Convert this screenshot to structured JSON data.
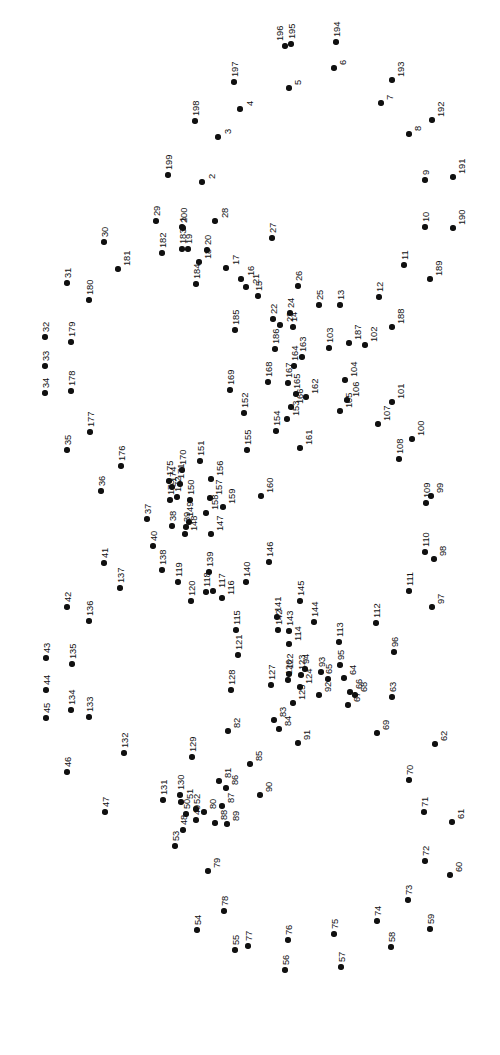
{
  "page": {
    "width": 500,
    "height": 1055,
    "background_color": "#ffffff",
    "dot_color": "#101010",
    "label_color": "#101010",
    "label_rotation_deg": -90,
    "dot_count": 200,
    "type": "connect-the-dots"
  },
  "dots": [
    {
      "n": "1",
      "x": 182,
      "y": 227,
      "lx": -4,
      "ly": -5
    },
    {
      "n": "2",
      "x": 202,
      "y": 182,
      "lx": 5,
      "ly": -3
    },
    {
      "n": "3",
      "x": 218,
      "y": 137,
      "lx": 5,
      "ly": -3
    },
    {
      "n": "4",
      "x": 240,
      "y": 109,
      "lx": 5,
      "ly": -3
    },
    {
      "n": "5",
      "x": 289,
      "y": 88,
      "lx": 4,
      "ly": -3
    },
    {
      "n": "6",
      "x": 334,
      "y": 68,
      "lx": 4,
      "ly": -3
    },
    {
      "n": "7",
      "x": 381,
      "y": 103,
      "lx": 4,
      "ly": -3
    },
    {
      "n": "8",
      "x": 409,
      "y": 134,
      "lx": 4,
      "ly": -3
    },
    {
      "n": "9",
      "x": 425,
      "y": 180,
      "lx": -4,
      "ly": -5
    },
    {
      "n": "10",
      "x": 425,
      "y": 227,
      "lx": -4,
      "ly": -5
    },
    {
      "n": "11",
      "x": 404,
      "y": 265,
      "lx": -4,
      "ly": -5
    },
    {
      "n": "12",
      "x": 379,
      "y": 297,
      "lx": -4,
      "ly": -5
    },
    {
      "n": "13",
      "x": 340,
      "y": 305,
      "lx": -4,
      "ly": -5
    },
    {
      "n": "14",
      "x": 293,
      "y": 327,
      "lx": -4,
      "ly": -5
    },
    {
      "n": "15",
      "x": 258,
      "y": 296,
      "lx": -4,
      "ly": -5
    },
    {
      "n": "16",
      "x": 241,
      "y": 279,
      "lx": 5,
      "ly": -3
    },
    {
      "n": "17",
      "x": 226,
      "y": 268,
      "lx": 5,
      "ly": -3
    },
    {
      "n": "18",
      "x": 199,
      "y": 262,
      "lx": 4,
      "ly": -3
    },
    {
      "n": "19",
      "x": 188,
      "y": 249,
      "lx": -4,
      "ly": -5
    },
    {
      "n": "20",
      "x": 207,
      "y": 250,
      "lx": -4,
      "ly": -5
    },
    {
      "n": "21",
      "x": 246,
      "y": 287,
      "lx": 5,
      "ly": -3
    },
    {
      "n": "22",
      "x": 273,
      "y": 319,
      "lx": -4,
      "ly": -5
    },
    {
      "n": "23",
      "x": 280,
      "y": 325,
      "lx": 5,
      "ly": -3
    },
    {
      "n": "24",
      "x": 290,
      "y": 313,
      "lx": -4,
      "ly": -5
    },
    {
      "n": "25",
      "x": 319,
      "y": 305,
      "lx": -4,
      "ly": -5
    },
    {
      "n": "26",
      "x": 298,
      "y": 286,
      "lx": -4,
      "ly": -5
    },
    {
      "n": "27",
      "x": 272,
      "y": 238,
      "lx": -4,
      "ly": -5
    },
    {
      "n": "28",
      "x": 215,
      "y": 221,
      "lx": 5,
      "ly": -3
    },
    {
      "n": "29",
      "x": 156,
      "y": 221,
      "lx": -4,
      "ly": -5
    },
    {
      "n": "30",
      "x": 104,
      "y": 242,
      "lx": -4,
      "ly": -5
    },
    {
      "n": "31",
      "x": 67,
      "y": 283,
      "lx": -4,
      "ly": -5
    },
    {
      "n": "32",
      "x": 45,
      "y": 337,
      "lx": -4,
      "ly": -5
    },
    {
      "n": "33",
      "x": 45,
      "y": 366,
      "lx": -4,
      "ly": -5
    },
    {
      "n": "34",
      "x": 45,
      "y": 393,
      "lx": -4,
      "ly": -5
    },
    {
      "n": "35",
      "x": 67,
      "y": 450,
      "lx": -4,
      "ly": -5
    },
    {
      "n": "36",
      "x": 101,
      "y": 491,
      "lx": -4,
      "ly": -5
    },
    {
      "n": "37",
      "x": 147,
      "y": 519,
      "lx": -4,
      "ly": -5
    },
    {
      "n": "38",
      "x": 172,
      "y": 526,
      "lx": -4,
      "ly": -5
    },
    {
      "n": "39",
      "x": 186,
      "y": 527,
      "lx": -4,
      "ly": -5
    },
    {
      "n": "40",
      "x": 153,
      "y": 546,
      "lx": -4,
      "ly": -5
    },
    {
      "n": "41",
      "x": 104,
      "y": 563,
      "lx": -4,
      "ly": -5
    },
    {
      "n": "42",
      "x": 67,
      "y": 607,
      "lx": -4,
      "ly": -5
    },
    {
      "n": "43",
      "x": 46,
      "y": 658,
      "lx": -4,
      "ly": -5
    },
    {
      "n": "44",
      "x": 46,
      "y": 690,
      "lx": -4,
      "ly": -5
    },
    {
      "n": "45",
      "x": 46,
      "y": 718,
      "lx": -4,
      "ly": -5
    },
    {
      "n": "46",
      "x": 67,
      "y": 772,
      "lx": -4,
      "ly": -5
    },
    {
      "n": "47",
      "x": 105,
      "y": 812,
      "lx": -4,
      "ly": -5
    },
    {
      "n": "48",
      "x": 183,
      "y": 830,
      "lx": -4,
      "ly": -5
    },
    {
      "n": "49",
      "x": 196,
      "y": 820,
      "lx": -4,
      "ly": -5
    },
    {
      "n": "50",
      "x": 186,
      "y": 814,
      "lx": -4,
      "ly": -5
    },
    {
      "n": "51",
      "x": 181,
      "y": 802,
      "lx": 4,
      "ly": -3
    },
    {
      "n": "52",
      "x": 196,
      "y": 809,
      "lx": -4,
      "ly": -5
    },
    {
      "n": "53",
      "x": 175,
      "y": 846,
      "lx": -4,
      "ly": -5
    },
    {
      "n": "54",
      "x": 197,
      "y": 930,
      "lx": -4,
      "ly": -5
    },
    {
      "n": "55",
      "x": 235,
      "y": 950,
      "lx": -4,
      "ly": -5
    },
    {
      "n": "56",
      "x": 285,
      "y": 970,
      "lx": -4,
      "ly": -5
    },
    {
      "n": "57",
      "x": 341,
      "y": 967,
      "lx": -4,
      "ly": -5
    },
    {
      "n": "58",
      "x": 391,
      "y": 947,
      "lx": -4,
      "ly": -5
    },
    {
      "n": "59",
      "x": 430,
      "y": 929,
      "lx": -4,
      "ly": -5
    },
    {
      "n": "60",
      "x": 450,
      "y": 875,
      "lx": 4,
      "ly": -3
    },
    {
      "n": "61",
      "x": 452,
      "y": 822,
      "lx": 4,
      "ly": -3
    },
    {
      "n": "62",
      "x": 435,
      "y": 744,
      "lx": 4,
      "ly": -3
    },
    {
      "n": "63",
      "x": 392,
      "y": 697,
      "lx": -4,
      "ly": -5
    },
    {
      "n": "64",
      "x": 344,
      "y": 678,
      "lx": 4,
      "ly": -3
    },
    {
      "n": "65",
      "x": 328,
      "y": 679,
      "lx": -4,
      "ly": -5
    },
    {
      "n": "66",
      "x": 350,
      "y": 692,
      "lx": 4,
      "ly": -3
    },
    {
      "n": "67",
      "x": 348,
      "y": 705,
      "lx": 4,
      "ly": -3
    },
    {
      "n": "68",
      "x": 355,
      "y": 695,
      "lx": 4,
      "ly": -3
    },
    {
      "n": "69",
      "x": 377,
      "y": 733,
      "lx": 4,
      "ly": -3
    },
    {
      "n": "70",
      "x": 409,
      "y": 780,
      "lx": -4,
      "ly": -5
    },
    {
      "n": "71",
      "x": 424,
      "y": 812,
      "lx": -4,
      "ly": -5
    },
    {
      "n": "72",
      "x": 425,
      "y": 861,
      "lx": -4,
      "ly": -5
    },
    {
      "n": "73",
      "x": 408,
      "y": 900,
      "lx": -4,
      "ly": -5
    },
    {
      "n": "74",
      "x": 377,
      "y": 921,
      "lx": -4,
      "ly": -5
    },
    {
      "n": "75",
      "x": 334,
      "y": 934,
      "lx": -4,
      "ly": -5
    },
    {
      "n": "76",
      "x": 288,
      "y": 940,
      "lx": -4,
      "ly": -5
    },
    {
      "n": "77",
      "x": 248,
      "y": 946,
      "lx": -4,
      "ly": -5
    },
    {
      "n": "78",
      "x": 224,
      "y": 911,
      "lx": -4,
      "ly": -5
    },
    {
      "n": "79",
      "x": 208,
      "y": 871,
      "lx": 4,
      "ly": -3
    },
    {
      "n": "80",
      "x": 204,
      "y": 812,
      "lx": 4,
      "ly": -3
    },
    {
      "n": "81",
      "x": 219,
      "y": 781,
      "lx": 4,
      "ly": -3
    },
    {
      "n": "82",
      "x": 228,
      "y": 731,
      "lx": 4,
      "ly": -3
    },
    {
      "n": "83",
      "x": 274,
      "y": 720,
      "lx": 4,
      "ly": -3
    },
    {
      "n": "84",
      "x": 279,
      "y": 729,
      "lx": 4,
      "ly": -3
    },
    {
      "n": "85",
      "x": 250,
      "y": 764,
      "lx": 4,
      "ly": -3
    },
    {
      "n": "86",
      "x": 226,
      "y": 788,
      "lx": 4,
      "ly": -3
    },
    {
      "n": "87",
      "x": 222,
      "y": 806,
      "lx": 4,
      "ly": -3
    },
    {
      "n": "88",
      "x": 215,
      "y": 823,
      "lx": 4,
      "ly": -3
    },
    {
      "n": "89",
      "x": 227,
      "y": 824,
      "lx": 4,
      "ly": -3
    },
    {
      "n": "90",
      "x": 260,
      "y": 795,
      "lx": 4,
      "ly": -3
    },
    {
      "n": "91",
      "x": 298,
      "y": 743,
      "lx": 4,
      "ly": -3
    },
    {
      "n": "92",
      "x": 319,
      "y": 695,
      "lx": 4,
      "ly": -3
    },
    {
      "n": "93",
      "x": 321,
      "y": 672,
      "lx": -4,
      "ly": -5
    },
    {
      "n": "94",
      "x": 305,
      "y": 669,
      "lx": -4,
      "ly": -5
    },
    {
      "n": "95",
      "x": 340,
      "y": 665,
      "lx": -4,
      "ly": -5
    },
    {
      "n": "96",
      "x": 394,
      "y": 652,
      "lx": -4,
      "ly": -5
    },
    {
      "n": "97",
      "x": 432,
      "y": 607,
      "lx": 4,
      "ly": -3
    },
    {
      "n": "98",
      "x": 434,
      "y": 559,
      "lx": 4,
      "ly": -3
    },
    {
      "n": "99",
      "x": 431,
      "y": 496,
      "lx": 4,
      "ly": -3
    },
    {
      "n": "100",
      "x": 412,
      "y": 439,
      "lx": 4,
      "ly": -3
    },
    {
      "n": "101",
      "x": 392,
      "y": 402,
      "lx": 4,
      "ly": -3
    },
    {
      "n": "102",
      "x": 365,
      "y": 345,
      "lx": 4,
      "ly": -3
    },
    {
      "n": "103",
      "x": 329,
      "y": 348,
      "lx": -4,
      "ly": -5
    },
    {
      "n": "104",
      "x": 345,
      "y": 380,
      "lx": 4,
      "ly": -3
    },
    {
      "n": "105",
      "x": 340,
      "y": 411,
      "lx": 4,
      "ly": -3
    },
    {
      "n": "106",
      "x": 347,
      "y": 400,
      "lx": 4,
      "ly": -3
    },
    {
      "n": "107",
      "x": 378,
      "y": 424,
      "lx": 4,
      "ly": -3
    },
    {
      "n": "108",
      "x": 399,
      "y": 459,
      "lx": -4,
      "ly": -5
    },
    {
      "n": "109",
      "x": 426,
      "y": 503,
      "lx": -4,
      "ly": -5
    },
    {
      "n": "110",
      "x": 425,
      "y": 552,
      "lx": -4,
      "ly": -5
    },
    {
      "n": "111",
      "x": 409,
      "y": 591,
      "lx": -4,
      "ly": -5
    },
    {
      "n": "112",
      "x": 376,
      "y": 623,
      "lx": -4,
      "ly": -5
    },
    {
      "n": "113",
      "x": 339,
      "y": 642,
      "lx": -4,
      "ly": -5
    },
    {
      "n": "114",
      "x": 289,
      "y": 644,
      "lx": 4,
      "ly": -3
    },
    {
      "n": "115",
      "x": 236,
      "y": 630,
      "lx": -4,
      "ly": -5
    },
    {
      "n": "116",
      "x": 222,
      "y": 598,
      "lx": 4,
      "ly": -3
    },
    {
      "n": "117",
      "x": 213,
      "y": 591,
      "lx": 4,
      "ly": -3
    },
    {
      "n": "118",
      "x": 206,
      "y": 592,
      "lx": -4,
      "ly": -5
    },
    {
      "n": "119",
      "x": 178,
      "y": 582,
      "lx": -4,
      "ly": -5
    },
    {
      "n": "120",
      "x": 191,
      "y": 601,
      "lx": -4,
      "ly": -5
    },
    {
      "n": "121",
      "x": 238,
      "y": 655,
      "lx": -4,
      "ly": -5
    },
    {
      "n": "122",
      "x": 289,
      "y": 674,
      "lx": -4,
      "ly": -5
    },
    {
      "n": "123",
      "x": 301,
      "y": 675,
      "lx": -4,
      "ly": -5
    },
    {
      "n": "124",
      "x": 300,
      "y": 687,
      "lx": 4,
      "ly": -3
    },
    {
      "n": "125",
      "x": 293,
      "y": 703,
      "lx": 4,
      "ly": -3
    },
    {
      "n": "126",
      "x": 288,
      "y": 680,
      "lx": -4,
      "ly": -5
    },
    {
      "n": "127",
      "x": 271,
      "y": 685,
      "lx": -4,
      "ly": -5
    },
    {
      "n": "128",
      "x": 231,
      "y": 690,
      "lx": -4,
      "ly": -5
    },
    {
      "n": "129",
      "x": 192,
      "y": 757,
      "lx": -4,
      "ly": -5
    },
    {
      "n": "130",
      "x": 180,
      "y": 795,
      "lx": -4,
      "ly": -5
    },
    {
      "n": "131",
      "x": 163,
      "y": 800,
      "lx": -4,
      "ly": -5
    },
    {
      "n": "132",
      "x": 124,
      "y": 753,
      "lx": -4,
      "ly": -5
    },
    {
      "n": "133",
      "x": 89,
      "y": 717,
      "lx": -4,
      "ly": -5
    },
    {
      "n": "134",
      "x": 71,
      "y": 710,
      "lx": -4,
      "ly": -5
    },
    {
      "n": "135",
      "x": 72,
      "y": 664,
      "lx": -4,
      "ly": -5
    },
    {
      "n": "136",
      "x": 89,
      "y": 621,
      "lx": -4,
      "ly": -5
    },
    {
      "n": "137",
      "x": 120,
      "y": 588,
      "lx": -4,
      "ly": -5
    },
    {
      "n": "138",
      "x": 162,
      "y": 570,
      "lx": -4,
      "ly": -5
    },
    {
      "n": "139",
      "x": 209,
      "y": 572,
      "lx": -4,
      "ly": -5
    },
    {
      "n": "140",
      "x": 246,
      "y": 582,
      "lx": -4,
      "ly": -5
    },
    {
      "n": "141",
      "x": 277,
      "y": 617,
      "lx": -4,
      "ly": -5
    },
    {
      "n": "142",
      "x": 278,
      "y": 630,
      "lx": -4,
      "ly": -5
    },
    {
      "n": "143",
      "x": 289,
      "y": 631,
      "lx": -4,
      "ly": -5
    },
    {
      "n": "144",
      "x": 314,
      "y": 622,
      "lx": -4,
      "ly": -5
    },
    {
      "n": "145",
      "x": 300,
      "y": 601,
      "lx": -4,
      "ly": -5
    },
    {
      "n": "146",
      "x": 269,
      "y": 562,
      "lx": -4,
      "ly": -5
    },
    {
      "n": "147",
      "x": 211,
      "y": 534,
      "lx": 4,
      "ly": -3
    },
    {
      "n": "148",
      "x": 185,
      "y": 534,
      "lx": 4,
      "ly": -3
    },
    {
      "n": "149",
      "x": 189,
      "y": 522,
      "lx": -4,
      "ly": -5
    },
    {
      "n": "150",
      "x": 190,
      "y": 500,
      "lx": -4,
      "ly": -5
    },
    {
      "n": "151",
      "x": 200,
      "y": 461,
      "lx": -4,
      "ly": -5
    },
    {
      "n": "152",
      "x": 244,
      "y": 413,
      "lx": -4,
      "ly": -5
    },
    {
      "n": "153",
      "x": 287,
      "y": 419,
      "lx": 4,
      "ly": -3
    },
    {
      "n": "154",
      "x": 276,
      "y": 431,
      "lx": -4,
      "ly": -5
    },
    {
      "n": "155",
      "x": 247,
      "y": 450,
      "lx": -4,
      "ly": -5
    },
    {
      "n": "156",
      "x": 211,
      "y": 479,
      "lx": 4,
      "ly": -3
    },
    {
      "n": "157",
      "x": 210,
      "y": 498,
      "lx": 4,
      "ly": -3
    },
    {
      "n": "158",
      "x": 206,
      "y": 513,
      "lx": 4,
      "ly": -3
    },
    {
      "n": "159",
      "x": 223,
      "y": 507,
      "lx": 4,
      "ly": -3
    },
    {
      "n": "160",
      "x": 261,
      "y": 496,
      "lx": 4,
      "ly": -3
    },
    {
      "n": "161",
      "x": 300,
      "y": 448,
      "lx": 4,
      "ly": -3
    },
    {
      "n": "162",
      "x": 306,
      "y": 397,
      "lx": 4,
      "ly": -3
    },
    {
      "n": "163",
      "x": 302,
      "y": 357,
      "lx": -4,
      "ly": -5
    },
    {
      "n": "164",
      "x": 294,
      "y": 366,
      "lx": -4,
      "ly": -5
    },
    {
      "n": "165",
      "x": 296,
      "y": 394,
      "lx": -4,
      "ly": -5
    },
    {
      "n": "166",
      "x": 291,
      "y": 407,
      "lx": 4,
      "ly": -3
    },
    {
      "n": "167",
      "x": 288,
      "y": 383,
      "lx": -4,
      "ly": -5
    },
    {
      "n": "168",
      "x": 268,
      "y": 382,
      "lx": -4,
      "ly": -5
    },
    {
      "n": "169",
      "x": 230,
      "y": 390,
      "lx": -4,
      "ly": -5
    },
    {
      "n": "170",
      "x": 182,
      "y": 470,
      "lx": -4,
      "ly": -5
    },
    {
      "n": "171",
      "x": 180,
      "y": 484,
      "lx": -4,
      "ly": -5
    },
    {
      "n": "172",
      "x": 177,
      "y": 497,
      "lx": -4,
      "ly": -5
    },
    {
      "n": "173",
      "x": 170,
      "y": 500,
      "lx": -4,
      "ly": -5
    },
    {
      "n": "174",
      "x": 172,
      "y": 487,
      "lx": -4,
      "ly": -5
    },
    {
      "n": "175",
      "x": 169,
      "y": 481,
      "lx": -4,
      "ly": -5
    },
    {
      "n": "176",
      "x": 121,
      "y": 466,
      "lx": -4,
      "ly": -5
    },
    {
      "n": "177",
      "x": 90,
      "y": 432,
      "lx": -4,
      "ly": -5
    },
    {
      "n": "178",
      "x": 71,
      "y": 391,
      "lx": -4,
      "ly": -5
    },
    {
      "n": "179",
      "x": 71,
      "y": 342,
      "lx": -4,
      "ly": -5
    },
    {
      "n": "180",
      "x": 89,
      "y": 300,
      "lx": -4,
      "ly": -5
    },
    {
      "n": "181",
      "x": 118,
      "y": 269,
      "lx": 4,
      "ly": -3
    },
    {
      "n": "182",
      "x": 162,
      "y": 253,
      "lx": -4,
      "ly": -5
    },
    {
      "n": "183",
      "x": 182,
      "y": 249,
      "lx": -4,
      "ly": -5
    },
    {
      "n": "184",
      "x": 196,
      "y": 284,
      "lx": -4,
      "ly": -5
    },
    {
      "n": "185",
      "x": 235,
      "y": 330,
      "lx": -4,
      "ly": -5
    },
    {
      "n": "186",
      "x": 275,
      "y": 349,
      "lx": -4,
      "ly": -5
    },
    {
      "n": "187",
      "x": 349,
      "y": 343,
      "lx": 4,
      "ly": -3
    },
    {
      "n": "188",
      "x": 392,
      "y": 327,
      "lx": 4,
      "ly": -3
    },
    {
      "n": "189",
      "x": 430,
      "y": 279,
      "lx": 4,
      "ly": -3
    },
    {
      "n": "190",
      "x": 453,
      "y": 228,
      "lx": 4,
      "ly": -3
    },
    {
      "n": "191",
      "x": 453,
      "y": 177,
      "lx": 4,
      "ly": -3
    },
    {
      "n": "192",
      "x": 432,
      "y": 120,
      "lx": 4,
      "ly": -3
    },
    {
      "n": "193",
      "x": 392,
      "y": 80,
      "lx": 4,
      "ly": -3
    },
    {
      "n": "194",
      "x": 336,
      "y": 42,
      "lx": -4,
      "ly": -5
    },
    {
      "n": "195",
      "x": 291,
      "y": 44,
      "lx": -4,
      "ly": -5
    },
    {
      "n": "196",
      "x": 285,
      "y": 46,
      "lx": -10,
      "ly": -5
    },
    {
      "n": "197",
      "x": 234,
      "y": 82,
      "lx": -4,
      "ly": -5
    },
    {
      "n": "198",
      "x": 195,
      "y": 121,
      "lx": -4,
      "ly": -5
    },
    {
      "n": "199",
      "x": 168,
      "y": 175,
      "lx": -4,
      "ly": -5
    },
    {
      "n": "200",
      "x": 183,
      "y": 228,
      "lx": -4,
      "ly": -5
    }
  ]
}
